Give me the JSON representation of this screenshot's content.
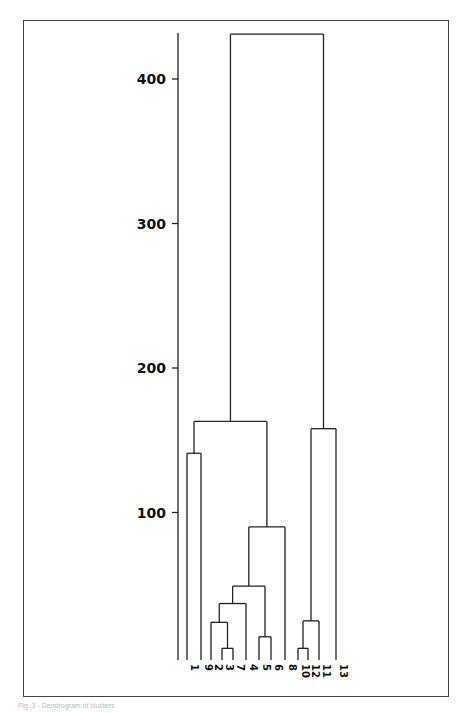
{
  "chart_data": {
    "type": "dendrogram",
    "title": "",
    "xlabel": "",
    "ylabel": "",
    "ylim": [
      0,
      435
    ],
    "y_ticks": [
      100,
      200,
      300,
      400
    ],
    "y_tick_labels": [
      "100",
      "200",
      "300",
      "400"
    ],
    "grid": false,
    "leaf_order": [
      "1",
      "9",
      "2",
      "3",
      "7",
      "4",
      "5",
      "6",
      "8",
      "10",
      "12",
      "11",
      "13"
    ],
    "merges": [
      {
        "left": "3",
        "right": "7",
        "height": 6
      },
      {
        "left": "10",
        "right": "12",
        "height": 6
      },
      {
        "left": "5",
        "right": "6",
        "height": 14
      },
      {
        "left": "2",
        "right": "(3,7)",
        "height": 24
      },
      {
        "left": "(10,12)",
        "right": "11",
        "height": 25
      },
      {
        "left": "(2,3,7)",
        "right": "4",
        "height": 37
      },
      {
        "left": "(2,3,7,4)",
        "right": "(5,6)",
        "height": 49
      },
      {
        "left": "(2,3,7,4,5,6)",
        "right": "8",
        "height": 90
      },
      {
        "left": "1",
        "right": "9",
        "height": 141
      },
      {
        "left": "(10,12,11)",
        "right": "13",
        "height": 158
      },
      {
        "left": "(1,9)",
        "right": "(2,3,7,4,5,6,8)",
        "height": 163
      },
      {
        "left": "(1,9,2,3,7,4,5,6,8)",
        "right": "(10,12,11,13)",
        "height": 431
      }
    ]
  },
  "caption": "Fig. 3 - Dendrogram of clusters"
}
